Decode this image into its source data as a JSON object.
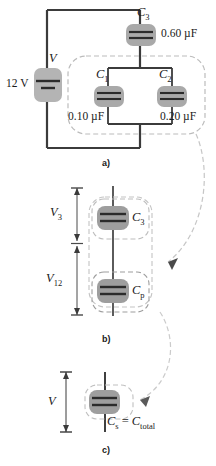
{
  "figure": {
    "colors": {
      "wire": "#3b3b3b",
      "cap_highlight": "#a9a9a9",
      "dashed_group": "#b9b9b9",
      "arrow": "#c2c2c2",
      "background": "#ffffff",
      "text": "#1a1a1a"
    }
  },
  "panel_a": {
    "label": "a)",
    "source_label": "V",
    "source_value": "12 V",
    "c3_label": "C",
    "c3_sub": "3",
    "c3_value": "0.60 µF",
    "c1_label": "C",
    "c1_sub": "1",
    "c1_value": "0.10 µF",
    "c2_label": "C",
    "c2_sub": "2",
    "c2_value": "0.20 µF"
  },
  "panel_b": {
    "label": "b)",
    "v3_label": "V",
    "v3_sub": "3",
    "v12_label": "V",
    "v12_sub": "12",
    "c3_label": "C",
    "c3_sub": "3",
    "cp_label": "C",
    "cp_sub": "p"
  },
  "panel_c": {
    "label": "c)",
    "v_label": "V",
    "cs_label": "C",
    "cs_sub": "s",
    "equals": "=",
    "ctotal_label": "C",
    "ctotal_sub": "total"
  }
}
